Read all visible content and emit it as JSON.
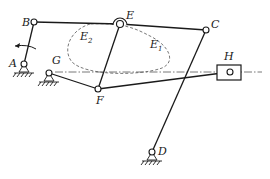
{
  "diagram": {
    "type": "planar linkage mechanism",
    "points": {
      "A": {
        "label": "A",
        "x": 24,
        "y": 64
      },
      "B": {
        "label": "B",
        "x": 34,
        "y": 22
      },
      "E": {
        "label": "E",
        "x": 120,
        "y": 24
      },
      "C": {
        "label": "C",
        "x": 206,
        "y": 30
      },
      "G": {
        "label": "G",
        "x": 49,
        "y": 73
      },
      "F": {
        "label": "F",
        "x": 98,
        "y": 89
      },
      "H": {
        "label": "H",
        "x": 230,
        "y": 72
      },
      "D": {
        "label": "D",
        "x": 152,
        "y": 152
      }
    },
    "curves": {
      "E1": {
        "label": "E",
        "sub": "1"
      },
      "E2": {
        "label": "E",
        "sub": "2"
      }
    },
    "colors": {
      "line": "#1a1a1a",
      "dashed": "#555555",
      "background": "#ffffff"
    }
  }
}
